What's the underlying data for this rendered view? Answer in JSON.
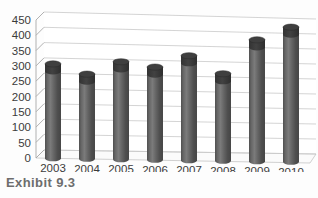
{
  "figure": {
    "caption": "Exhibit 9.3"
  },
  "chart_data": {
    "type": "bar",
    "title": "",
    "subtitle": "",
    "xlabel": "",
    "ylabel": "",
    "categories": [
      "2003",
      "2004",
      "2005",
      "2006",
      "2007",
      "2008",
      "2009",
      "2010"
    ],
    "values": [
      308,
      277,
      320,
      305,
      345,
      288,
      403,
      448
    ],
    "ylim": [
      0,
      450
    ],
    "ytick_labels": [
      "0",
      "50",
      "100",
      "150",
      "200",
      "250",
      "300",
      "350",
      "400",
      "450"
    ],
    "ytick_values": [
      0,
      50,
      100,
      150,
      200,
      250,
      300,
      350,
      400,
      450
    ],
    "grid": true,
    "grid_axis": "y",
    "legend": false,
    "legend_position": "none",
    "style": "3d-cylinder",
    "series": [
      {
        "name": "Series 1",
        "values": [
          308,
          277,
          320,
          305,
          345,
          288,
          403,
          448
        ]
      }
    ],
    "colors": {
      "bar_body": "#5a5a5a",
      "bar_body_light": "#7c7c7c",
      "bar_body_dark": "#474747",
      "bar_top": "#3a3a3a",
      "gridline": "#c9c9c9",
      "axis": "#a8a8a8",
      "floor": "#fbfbfb",
      "text": "#3b3b3b",
      "caption": "#6d6d6d"
    }
  }
}
